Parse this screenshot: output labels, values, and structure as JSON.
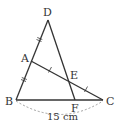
{
  "figure": {
    "points": {
      "D": {
        "label": "D",
        "x": 48,
        "y": 20
      },
      "A": {
        "label": "A",
        "x": 31,
        "y": 61
      },
      "B": {
        "label": "B",
        "x": 16,
        "y": 100
      },
      "C": {
        "label": "C",
        "x": 103,
        "y": 100
      },
      "E": {
        "label": "E",
        "x": 69,
        "y": 79
      },
      "F": {
        "label": "F",
        "x": 75,
        "y": 100
      }
    },
    "segments": [
      "DB",
      "DF",
      "AC",
      "BC"
    ],
    "equal_marks": {
      "double": [
        "DA",
        "AB"
      ],
      "single": [
        "AE",
        "EC"
      ]
    },
    "dimension": {
      "from": "B",
      "to": "C",
      "label": "15 cm"
    },
    "colors": {
      "line": "#333333",
      "dimension": "#888888"
    }
  }
}
